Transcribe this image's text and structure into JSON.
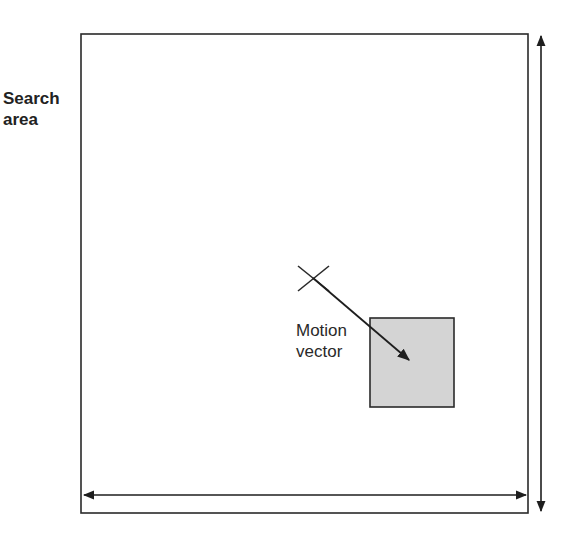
{
  "labels": {
    "search_area_line1": "Search",
    "search_area_line2": "area",
    "motion_vector_line1": "Motion",
    "motion_vector_line2": "vector"
  },
  "colors": {
    "stroke": "#2a2a2a",
    "block_fill": "#d4d4d4",
    "background": "#ffffff"
  }
}
